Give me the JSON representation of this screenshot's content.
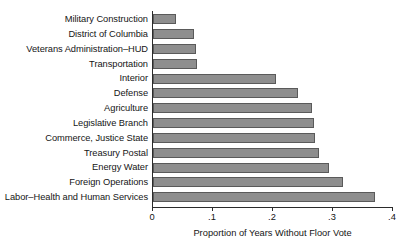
{
  "chart_data": {
    "type": "bar",
    "orientation": "horizontal",
    "title": "",
    "xlabel": "Proportion of Years Without Floor Vote",
    "ylabel": "",
    "xlim": [
      0,
      0.4
    ],
    "xticks": [
      0,
      0.1,
      0.2,
      0.3,
      0.4
    ],
    "xticklabels": [
      "0",
      ".1",
      ".2",
      ".3",
      ".4"
    ],
    "grid": false,
    "legend": false,
    "bar_color": "#8e8e8e",
    "bar_edge_color": "#5a5a5a",
    "axis_color": "#2b2b2b",
    "categories": [
      "Military Construction",
      "District of Columbia",
      "Veterans Administration–HUD",
      "Transportation",
      "Interior",
      "Defense",
      "Agriculture",
      "Legislative Branch",
      "Commerce, Justice State",
      "Treasury Postal",
      "Energy Water",
      "Foreign Operations",
      "Labor–Health and Human Services"
    ],
    "values": [
      0.038,
      0.068,
      0.071,
      0.074,
      0.205,
      0.242,
      0.265,
      0.268,
      0.27,
      0.276,
      0.293,
      0.317,
      0.37
    ]
  }
}
